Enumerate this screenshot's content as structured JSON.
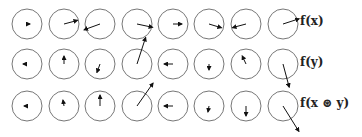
{
  "figure": {
    "columns": 8,
    "col_x": [
      27,
      64,
      100,
      137,
      173,
      209,
      246,
      283
    ],
    "radius": 15,
    "colors": {
      "circle": "#777777",
      "arrow": "#111111",
      "label": "#222222"
    },
    "rows": [
      {
        "label": "f(x)",
        "cy": 24,
        "vectors": [
          {
            "angle": 0,
            "length": 3
          },
          {
            "angle": 15,
            "length": 14
          },
          {
            "angle": 200,
            "length": 17
          },
          {
            "angle": -12,
            "length": 16
          },
          {
            "angle": 0,
            "length": 9
          },
          {
            "angle": -17,
            "length": 13
          },
          {
            "angle": 195,
            "length": 14
          },
          {
            "angle": 18,
            "length": 17
          }
        ]
      },
      {
        "label": "f(y)",
        "cy": 64,
        "vectors": [
          {
            "angle": 180,
            "length": 4
          },
          {
            "angle": 90,
            "length": 8
          },
          {
            "angle": -110,
            "length": 9
          },
          {
            "angle": 72,
            "length": 28
          },
          {
            "angle": 180,
            "length": 9
          },
          {
            "angle": -90,
            "length": 6
          },
          {
            "angle": 115,
            "length": 9
          },
          {
            "angle": -75,
            "length": 24
          }
        ]
      },
      {
        "label": "f(x ⊛ y)",
        "cy": 106,
        "vectors": [
          {
            "angle": 180,
            "length": 3
          },
          {
            "angle": 100,
            "length": 6
          },
          {
            "angle": 90,
            "length": 11
          },
          {
            "angle": 55,
            "length": 28
          },
          {
            "angle": 180,
            "length": 9
          },
          {
            "angle": -100,
            "length": 6
          },
          {
            "angle": -90,
            "length": 10
          },
          {
            "angle": -58,
            "length": 30
          }
        ]
      }
    ]
  }
}
